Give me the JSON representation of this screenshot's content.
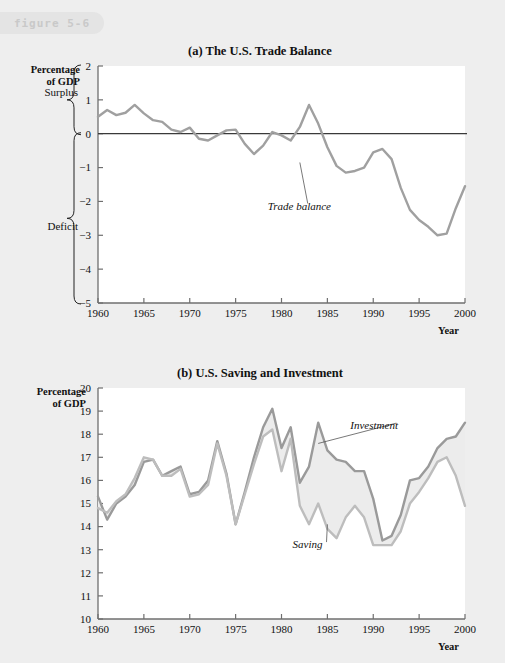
{
  "figure": {
    "tab_label": "figure 5-6"
  },
  "panel_a": {
    "title": "(a) The U.S. Trade Balance",
    "y_axis_title_line1": "Percentage",
    "y_axis_title_line2": "of GDP",
    "x_axis_title": "Year",
    "brace_surplus": "Surplus",
    "brace_deficit": "Deficit",
    "series_label": "Trade balance"
  },
  "panel_b": {
    "title": "(b) U.S. Saving and Investment",
    "y_axis_title_line1": "Percentage",
    "y_axis_title_line2": "of GDP",
    "x_axis_title": "Year",
    "label_investment": "Investment",
    "label_saving": "Saving"
  },
  "colors": {
    "page_background": "#eeeeee",
    "plot_background": "#ffffff",
    "trade_balance_line": "#a0a0a0",
    "investment_line": "#9a9a9a",
    "saving_line": "#bdbdbd",
    "gap_fill": "#ececec",
    "zero_line": "#3a3a3a",
    "axis": "#6f6f6f",
    "text": "#111111",
    "tab_background": "#e4e4e4",
    "tab_text": "#c9c9c9"
  },
  "chart_data": [
    {
      "id": "trade-balance",
      "type": "line",
      "title": "(a) The U.S. Trade Balance",
      "xlabel": "Year",
      "ylabel": "Percentage of GDP",
      "xlim": [
        1960,
        2000
      ],
      "ylim": [
        -5,
        2
      ],
      "ytick_labels": [
        "2",
        "1",
        "0",
        "−1",
        "−2",
        "−3",
        "−4",
        "−5"
      ],
      "yticks": [
        2,
        1,
        0,
        -1,
        -2,
        -3,
        -4,
        -5
      ],
      "xticks": [
        1960,
        1965,
        1970,
        1975,
        1980,
        1985,
        1990,
        1995,
        2000
      ],
      "grid": false,
      "legend": "none",
      "annotations": [
        {
          "text": "Trade balance",
          "x": 1978.5,
          "y": -2.15,
          "leader_to_x": 1982.0,
          "leader_to_y": -0.85
        }
      ],
      "zero_reference_line": 0,
      "axis_braces": [
        {
          "label": "Surplus",
          "from": 0,
          "to": 2
        },
        {
          "label": "Deficit",
          "from": -5,
          "to": 0
        }
      ],
      "series": [
        {
          "name": "Trade balance",
          "x": [
            1960,
            1961,
            1962,
            1963,
            1964,
            1965,
            1966,
            1967,
            1968,
            1969,
            1970,
            1971,
            1972,
            1973,
            1974,
            1975,
            1976,
            1977,
            1978,
            1979,
            1980,
            1981,
            1982,
            1983,
            1984,
            1985,
            1986,
            1987,
            1988,
            1989,
            1990,
            1991,
            1992,
            1993,
            1994,
            1995,
            1996,
            1997,
            1998,
            1999,
            2000
          ],
          "values": [
            0.5,
            0.7,
            0.55,
            0.62,
            0.85,
            0.6,
            0.4,
            0.35,
            0.12,
            0.05,
            0.18,
            -0.15,
            -0.2,
            -0.05,
            0.1,
            0.12,
            -0.3,
            -0.6,
            -0.35,
            0.05,
            -0.05,
            -0.2,
            0.2,
            0.85,
            0.3,
            -0.4,
            -0.95,
            -1.15,
            -1.1,
            -1.0,
            -0.55,
            -0.45,
            -0.75,
            -1.6,
            -2.25,
            -2.55,
            -2.75,
            -3.0,
            -2.95,
            -2.2,
            -1.55,
            -0.85,
            -0.35,
            -0.45,
            -0.6,
            -0.55,
            -0.55,
            -0.52,
            -1.1,
            -2.3,
            -3.65
          ]
        }
      ]
    },
    {
      "id": "saving-investment",
      "type": "line",
      "title": "(b) U.S. Saving and Investment",
      "xlabel": "Year",
      "ylabel": "Percentage of GDP",
      "xlim": [
        1960,
        2000
      ],
      "ylim": [
        10,
        20
      ],
      "yticks": [
        10,
        11,
        12,
        13,
        14,
        15,
        16,
        17,
        18,
        19,
        20
      ],
      "ytick_labels": [
        "10",
        "11",
        "12",
        "13",
        "14",
        "15",
        "16",
        "17",
        "18",
        "19",
        "20"
      ],
      "xticks": [
        1960,
        1965,
        1970,
        1975,
        1980,
        1985,
        1990,
        1995,
        2000
      ],
      "grid": false,
      "legend": "inline-labels",
      "fill_between": true,
      "annotations": [
        {
          "text": "Investment",
          "x": 1987.5,
          "y": 18.35,
          "leader_to_x": 1984.0,
          "leader_to_y": 17.6
        },
        {
          "text": "Saving",
          "x": 1981.2,
          "y": 13.2,
          "leader_to_x": 1985.0,
          "leader_to_y": 14.1
        }
      ],
      "series": [
        {
          "name": "Investment",
          "x": [
            1960,
            1961,
            1962,
            1963,
            1964,
            1965,
            1966,
            1967,
            1968,
            1969,
            1970,
            1971,
            1972,
            1973,
            1974,
            1975,
            1976,
            1977,
            1978,
            1979,
            1980,
            1981,
            1982,
            1983,
            1984,
            1985,
            1986,
            1987,
            1988,
            1989,
            1990,
            1991,
            1992,
            1993,
            1994,
            1995,
            1996,
            1997,
            1998,
            1999,
            2000
          ],
          "values": [
            15.3,
            14.3,
            15.0,
            15.3,
            15.8,
            16.8,
            16.9,
            16.2,
            16.4,
            16.6,
            15.4,
            15.5,
            16.0,
            17.7,
            16.3,
            14.1,
            15.5,
            17.0,
            18.3,
            19.1,
            17.4,
            18.3,
            15.9,
            16.6,
            18.5,
            17.3,
            16.9,
            16.8,
            16.4,
            16.4,
            15.2,
            13.4,
            13.6,
            14.5,
            16.0,
            16.1,
            16.6,
            17.4,
            17.8,
            17.9,
            18.5
          ]
        },
        {
          "name": "Saving",
          "x": [
            1960,
            1961,
            1962,
            1963,
            1964,
            1965,
            1966,
            1967,
            1968,
            1969,
            1970,
            1971,
            1972,
            1973,
            1974,
            1975,
            1976,
            1977,
            1978,
            1979,
            1980,
            1981,
            1982,
            1983,
            1984,
            1985,
            1986,
            1987,
            1988,
            1989,
            1990,
            1991,
            1992,
            1993,
            1994,
            1995,
            1996,
            1997,
            1998,
            1999,
            2000
          ],
          "values": [
            14.8,
            14.6,
            15.1,
            15.4,
            16.1,
            17.0,
            16.9,
            16.2,
            16.2,
            16.5,
            15.3,
            15.4,
            15.8,
            17.6,
            16.2,
            14.1,
            15.4,
            16.7,
            17.9,
            18.2,
            16.4,
            17.8,
            14.9,
            14.1,
            15.0,
            13.9,
            13.5,
            14.4,
            14.9,
            14.4,
            13.2,
            13.2,
            13.2,
            13.8,
            15.0,
            15.5,
            16.1,
            16.8,
            17.0,
            16.2,
            14.9
          ]
        }
      ]
    }
  ]
}
